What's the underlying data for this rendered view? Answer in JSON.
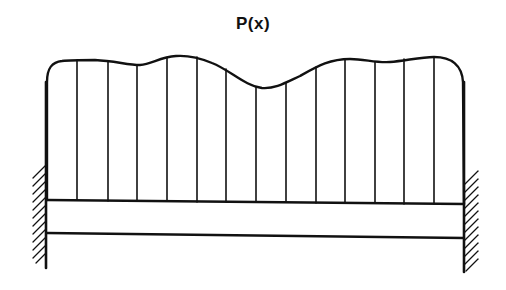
{
  "diagram": {
    "title": "P(x)",
    "colors": {
      "stroke": "#111111",
      "background": "#ffffff"
    },
    "elements": [
      "distributed-load-curve",
      "load-vertical-lines",
      "beam",
      "left-fixed-support",
      "right-fixed-support"
    ],
    "load_line_count": 13
  }
}
